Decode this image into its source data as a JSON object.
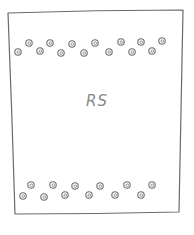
{
  "drawing": {
    "label": "RS",
    "stroke_color": "#6a6a6a",
    "background": "#ffffff",
    "frame": {
      "top_left": [
        8,
        13
      ],
      "top_right": [
        183,
        10
      ],
      "bottom_right": [
        179,
        212
      ],
      "bottom_left": [
        15,
        214
      ]
    },
    "top_dots": [
      [
        18,
        52
      ],
      [
        29,
        43
      ],
      [
        40,
        51
      ],
      [
        50,
        43
      ],
      [
        61,
        53
      ],
      [
        72,
        44
      ],
      [
        84,
        53
      ],
      [
        95,
        43
      ],
      [
        109,
        52
      ],
      [
        121,
        42
      ],
      [
        132,
        52
      ],
      [
        141,
        42
      ],
      [
        152,
        51
      ],
      [
        162,
        41
      ]
    ],
    "bottom_dots": [
      [
        23,
        196
      ],
      [
        31,
        185
      ],
      [
        44,
        197
      ],
      [
        53,
        185
      ],
      [
        65,
        195
      ],
      [
        75,
        186
      ],
      [
        89,
        195
      ],
      [
        100,
        186
      ],
      [
        115,
        195
      ],
      [
        127,
        185
      ],
      [
        141,
        195
      ],
      [
        152,
        185
      ]
    ]
  }
}
